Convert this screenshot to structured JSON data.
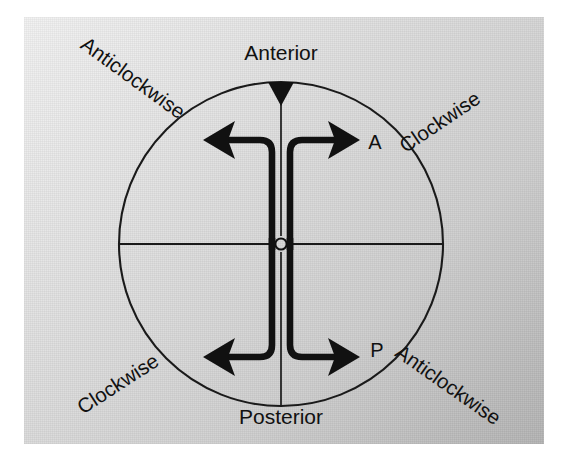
{
  "figure": {
    "kind": "anatomical-rotation-diagram",
    "caption_labels": {
      "anterior": "Anterior",
      "posterior": "Posterior",
      "center_point": "O",
      "anterior_point": "A",
      "posterior_point": "P"
    },
    "rotation_labels": {
      "top_left": "Anticlockwise",
      "top_right": "Clockwise",
      "bottom_left": "Clockwise",
      "bottom_right": "Anticlockwise"
    },
    "geometry": {
      "center_x": 281,
      "center_y": 244,
      "radius": 162,
      "marker_shape": "downward-triangle",
      "marker_position": "top-of-circle"
    },
    "arrows": [
      {
        "name": "anterior-left-arrow",
        "direction": "left",
        "half": "anterior"
      },
      {
        "name": "anterior-right-arrow",
        "direction": "right",
        "half": "anterior"
      },
      {
        "name": "posterior-left-arrow",
        "direction": "left",
        "half": "posterior"
      },
      {
        "name": "posterior-right-arrow",
        "direction": "right",
        "half": "posterior"
      }
    ],
    "colors": {
      "ink": "#111111",
      "stroke": "#1a1a1a",
      "panel_light": "#f2f2f2",
      "panel_dark": "#b4b4b4",
      "page": "#ffffff"
    }
  }
}
